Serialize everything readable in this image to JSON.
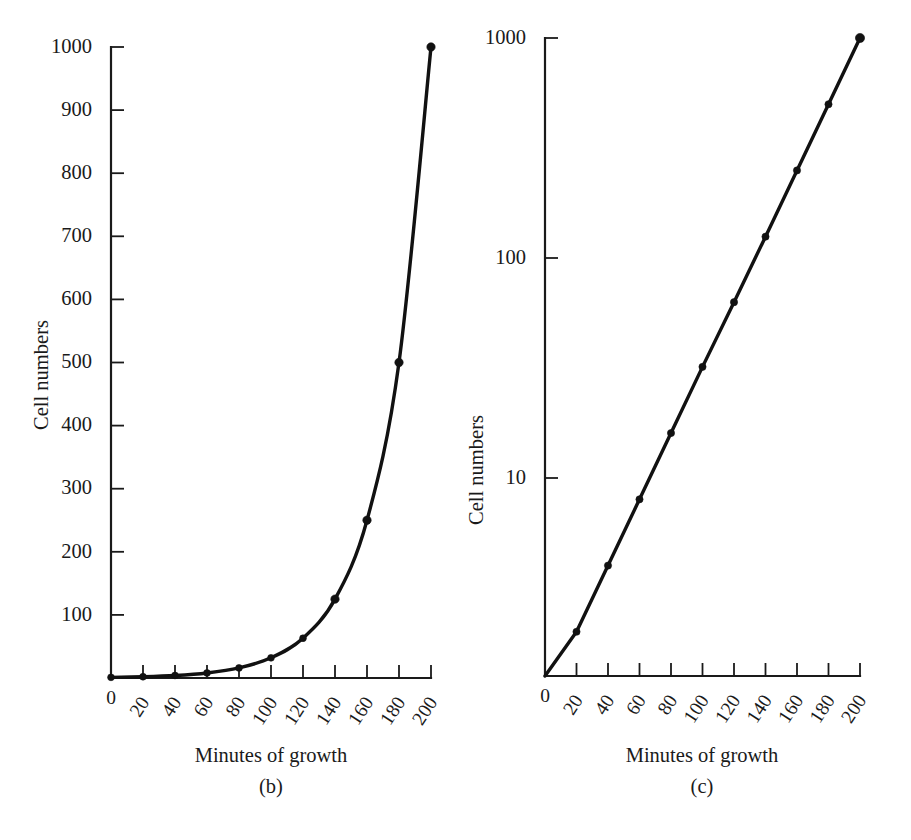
{
  "figure": {
    "background_color": "#ffffff",
    "ink_color": "#111111"
  },
  "chart_data": [
    {
      "type": "line",
      "panel_label": "(b)",
      "title": "",
      "xlabel": "Minutes of growth",
      "ylabel": "Cell numbers",
      "xlim": [
        0,
        200
      ],
      "ylim": [
        0,
        1000
      ],
      "yscale": "linear",
      "xscale": "linear",
      "grid": false,
      "legend": "none",
      "markers": "filled-circle",
      "x_tick_labels": [
        "0",
        "20",
        "40",
        "60",
        "80",
        "100",
        "120",
        "140",
        "160",
        "180",
        "200"
      ],
      "x_tick_values": [
        0,
        20,
        40,
        60,
        80,
        100,
        120,
        140,
        160,
        180,
        200
      ],
      "y_tick_labels": [
        "100",
        "200",
        "300",
        "400",
        "500",
        "600",
        "700",
        "800",
        "900",
        "1000"
      ],
      "y_tick_values": [
        100,
        200,
        300,
        400,
        500,
        600,
        700,
        800,
        900,
        1000
      ],
      "x": [
        0,
        20,
        40,
        60,
        80,
        100,
        120,
        140,
        160,
        180,
        200
      ],
      "values": [
        1,
        2,
        4,
        8,
        16,
        32,
        63,
        125,
        250,
        500,
        1000
      ],
      "series_name": "Cell numbers"
    },
    {
      "type": "line",
      "panel_label": "(c)",
      "title": "",
      "xlabel": "Minutes of growth",
      "ylabel": "Cell numbers",
      "xlim": [
        0,
        200
      ],
      "ylim": [
        1,
        1000
      ],
      "yscale": "log",
      "xscale": "linear",
      "grid": false,
      "legend": "none",
      "markers": "filled-circle",
      "x_tick_labels": [
        "0",
        "20",
        "40",
        "60",
        "80",
        "100",
        "120",
        "140",
        "160",
        "180",
        "200"
      ],
      "x_tick_values": [
        0,
        20,
        40,
        60,
        80,
        100,
        120,
        140,
        160,
        180,
        200
      ],
      "y_tick_labels": [
        "10",
        "100",
        "1000"
      ],
      "y_tick_values": [
        10,
        100,
        1000
      ],
      "x": [
        0,
        20,
        40,
        60,
        80,
        100,
        120,
        140,
        160,
        180,
        200
      ],
      "values": [
        1,
        2,
        4,
        8,
        16,
        32,
        63,
        125,
        250,
        500,
        1000
      ],
      "series_name": "Cell numbers"
    }
  ],
  "panel_b": {
    "caption": "(b)",
    "xlabel": "Minutes of growth",
    "ylabel": "Cell numbers",
    "y_ticks": [
      {
        "label": "1000",
        "value": 1000
      },
      {
        "label": "900",
        "value": 900
      },
      {
        "label": "800",
        "value": 800
      },
      {
        "label": "700",
        "value": 700
      },
      {
        "label": "600",
        "value": 600
      },
      {
        "label": "500",
        "value": 500
      },
      {
        "label": "400",
        "value": 400
      },
      {
        "label": "300",
        "value": 300
      },
      {
        "label": "200",
        "value": 200
      },
      {
        "label": "100",
        "value": 100
      }
    ],
    "x_ticks": [
      {
        "label": "0",
        "value": 0
      },
      {
        "label": "20",
        "value": 20
      },
      {
        "label": "40",
        "value": 40
      },
      {
        "label": "60",
        "value": 60
      },
      {
        "label": "80",
        "value": 80
      },
      {
        "label": "100",
        "value": 100
      },
      {
        "label": "120",
        "value": 120
      },
      {
        "label": "140",
        "value": 140
      },
      {
        "label": "160",
        "value": 160
      },
      {
        "label": "180",
        "value": 180
      },
      {
        "label": "200",
        "value": 200
      }
    ]
  },
  "panel_c": {
    "caption": "(c)",
    "xlabel": "Minutes of growth",
    "ylabel": "Cell numbers",
    "y_ticks": [
      {
        "label": "1000",
        "value": 1000
      },
      {
        "label": "100",
        "value": 100
      },
      {
        "label": "10",
        "value": 10
      }
    ],
    "x_ticks": [
      {
        "label": "0",
        "value": 0
      },
      {
        "label": "20",
        "value": 20
      },
      {
        "label": "40",
        "value": 40
      },
      {
        "label": "60",
        "value": 60
      },
      {
        "label": "80",
        "value": 80
      },
      {
        "label": "100",
        "value": 100
      },
      {
        "label": "120",
        "value": 120
      },
      {
        "label": "140",
        "value": 140
      },
      {
        "label": "160",
        "value": 160
      },
      {
        "label": "180",
        "value": 180
      },
      {
        "label": "200",
        "value": 200
      }
    ]
  }
}
